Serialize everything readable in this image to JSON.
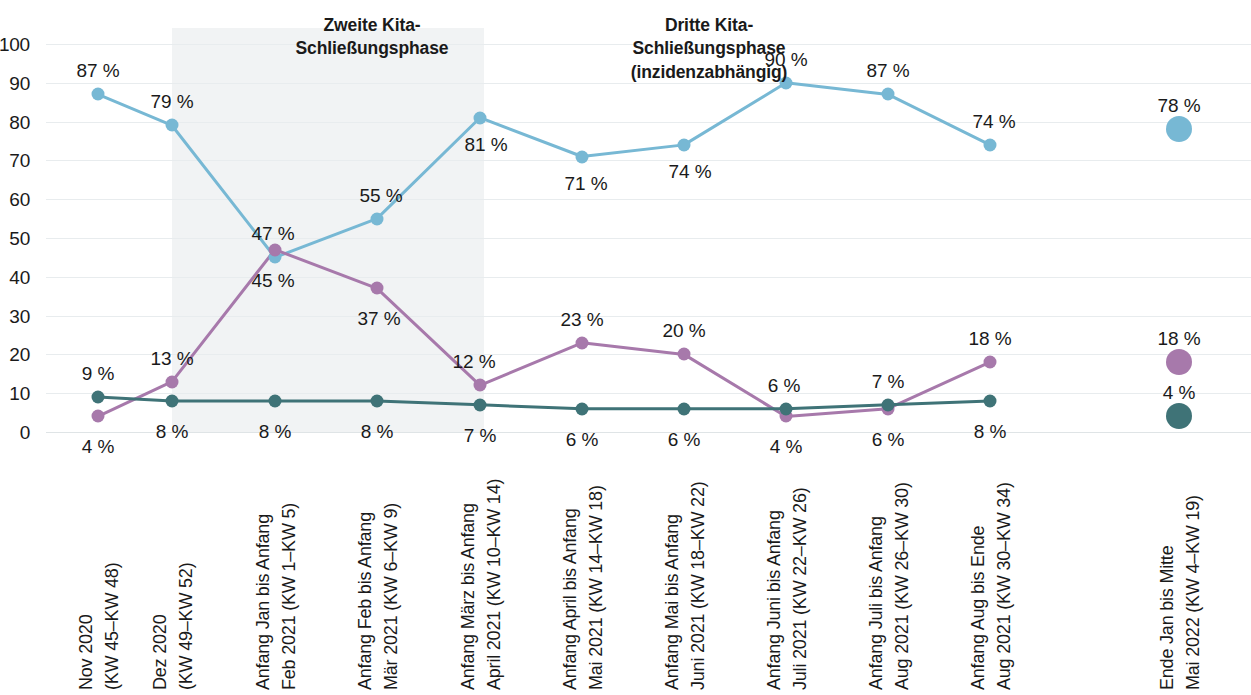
{
  "chart_data": {
    "type": "line",
    "title": "",
    "xlabel": "",
    "ylabel": "",
    "ylim": [
      0,
      100
    ],
    "yticks": [
      0,
      10,
      20,
      30,
      40,
      50,
      60,
      70,
      80,
      90,
      100
    ],
    "grid": true,
    "legend": "none",
    "value_suffix": " %",
    "categories": [
      "Nov 2020\n(KW 45–KW 48)",
      "Dez 2020\n(KW 49–KW 52)",
      "Anfang Jan bis Anfang\nFeb 2021 (KW 1–KW 5)",
      "Anfang Feb bis Anfang\nMär 2021 (KW 6–KW 9)",
      "Anfang März bis Anfang\nApril 2021 (KW 10–KW 14)",
      "Anfang April bis Anfang\nMai 2021 (KW 14–KW 18)",
      "Anfang Mai bis Anfang\nJuni 2021 (KW 18–KW 22)",
      "Anfang Juni bis Anfang\nJuli 2021 (KW 22–KW 26)",
      "Anfang Juli bis Anfang\nAug 2021 (KW 26–KW 30)",
      "Anfang Aug bis Ende\nAug 2021 (KW 30–KW 34)",
      "Ende Jan bis Mitte\nMai 2022 (KW 4–KW 19)"
    ],
    "series": [
      {
        "name": "blue-series",
        "color": "#77b8d4",
        "values": [
          87,
          79,
          45,
          55,
          81,
          71,
          74,
          90,
          87,
          74,
          78
        ],
        "labels": [
          "87 %",
          "79 %",
          "47 %",
          "55 %",
          "81 %",
          "71 %",
          "74 %",
          "90 %",
          "87 %",
          "74 %",
          "78 %"
        ]
      },
      {
        "name": "purple-series",
        "color": "#a779ab",
        "values": [
          4,
          13,
          47,
          37,
          12,
          23,
          20,
          4,
          6,
          18,
          18
        ],
        "labels": [
          "4 %",
          "13 %",
          "45 %",
          "37 %",
          "12 %",
          "23 %",
          "20 %",
          "4 %",
          "6 %",
          "18 %",
          "18 %"
        ]
      },
      {
        "name": "teal-series",
        "color": "#3f7377",
        "values": [
          9,
          8,
          8,
          8,
          7,
          6,
          6,
          6,
          7,
          8,
          4
        ],
        "labels": [
          "9 %",
          "8 %",
          "8 %",
          "8 %",
          "7 %",
          "6 %",
          "6 %",
          "6 %",
          "7 %",
          "8 %",
          "4 %"
        ]
      }
    ],
    "annotations": [
      {
        "name": "zweite-phase",
        "text": "Zweite Kita-\nSchließungsphase"
      },
      {
        "name": "dritte-phase",
        "text": "Dritte Kita-\nSchließungsphase\n(inzidenzabhängig)"
      }
    ],
    "shaded_band": {
      "label": "Zweite Kita-Schließungsphase",
      "color": "#eef1f2"
    },
    "colors": {
      "blue": "#77b8d4",
      "purple": "#a779ab",
      "teal": "#3f7377",
      "grid": "#e8ecee",
      "text": "#1a1a1a",
      "band": "#eef1f2"
    }
  }
}
